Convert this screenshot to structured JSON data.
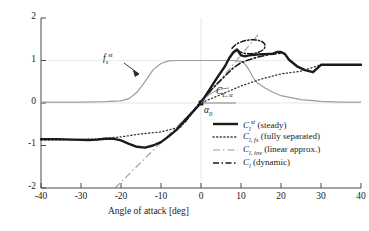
{
  "chart_data": {
    "type": "line",
    "title": "",
    "xlabel": "Angle of attack [deg]",
    "ylabel": "",
    "xlim": [
      -40,
      40
    ],
    "ylim": [
      -2,
      2
    ],
    "xticks": [
      "-40",
      "-30",
      "-20",
      "-10",
      "0",
      "10",
      "20",
      "30",
      "40"
    ],
    "xtick_values": [
      -40,
      -30,
      -20,
      -10,
      0,
      10,
      20,
      30,
      40
    ],
    "yticks": [
      "-2",
      "-1",
      "0",
      "1",
      "2"
    ],
    "ytick_values": [
      -2,
      -1,
      0,
      1,
      2
    ],
    "grid": "partial-light",
    "legend_position": "lower-right-inside",
    "series": [
      {
        "name": "Cl_st_steady",
        "label_html": "<i>C<sub>l</sub><sup>st</sup></i> (steady)",
        "style": "solid",
        "width": 2.4,
        "color": "#1a1a1a",
        "x": [
          -40,
          -36,
          -32,
          -28,
          -24,
          -22,
          -20,
          -18,
          -16,
          -14,
          -12,
          -10,
          -8,
          -6,
          -4,
          -2.5,
          0,
          2,
          4,
          6,
          8,
          9,
          10,
          11,
          12,
          13,
          14,
          16,
          18,
          20,
          21,
          22,
          23,
          24,
          26,
          28,
          30,
          32,
          34,
          36,
          38,
          40
        ],
        "y": [
          -0.85,
          -0.85,
          -0.86,
          -0.87,
          -0.87,
          -0.86,
          -0.84,
          -0.84,
          -0.88,
          -0.96,
          -1.03,
          -1.05,
          -1.0,
          -0.92,
          -0.78,
          -0.62,
          -0.3,
          0.0,
          0.3,
          0.62,
          0.92,
          1.05,
          1.14,
          1.2,
          1.12,
          1.1,
          1.12,
          1.14,
          1.15,
          1.16,
          1.2,
          1.21,
          1.19,
          1.12,
          1.0,
          0.94,
          0.91,
          0.9,
          0.9,
          0.9,
          0.9,
          0.9
        ]
      },
      {
        "name": "Cl_fs_fully_separated",
        "label_html": "<i>C<sub>l, fs</sub></i> (fully separated)",
        "style": "dotted",
        "width": 1.3,
        "color": "#3a3a3a",
        "x": [
          -40,
          -36,
          -32,
          -28,
          -24,
          -20,
          -16,
          -12,
          -8,
          -4,
          0,
          4,
          8,
          12,
          16,
          20,
          24,
          28,
          32,
          36,
          40
        ],
        "y": [
          -0.87,
          -0.87,
          -0.86,
          -0.84,
          -0.8,
          -0.75,
          -0.68,
          -0.56,
          -0.4,
          -0.2,
          0.0,
          0.2,
          0.4,
          0.56,
          0.68,
          0.78,
          0.85,
          0.89,
          0.9,
          0.9,
          0.9
        ]
      },
      {
        "name": "Cl_inv_linear_approx",
        "label_html": "<i>C<sub>l, inv</sub></i> (linear approx.)",
        "style": "dashdot-light",
        "width": 1.0,
        "color": "#8a8a8a",
        "x": [
          -21.5,
          0,
          14.5
        ],
        "y": [
          -2.0,
          0.0,
          1.75
        ]
      },
      {
        "name": "Cl_dynamic",
        "label_html": "<i>C<sub>l</sub></i> (dynamic)",
        "style": "dashdot-dark",
        "width": 1.6,
        "color": "#1a1a1a",
        "x": [
          -4,
          0,
          4,
          8,
          10,
          12,
          14,
          16,
          18,
          20,
          22
        ],
        "y": [
          -0.45,
          0.05,
          0.45,
          0.82,
          0.95,
          1.02,
          1.07,
          1.1,
          1.13,
          1.15,
          1.16
        ],
        "loop_note": "small hysteresis loop above the steady peak near 12-18 deg"
      },
      {
        "name": "fs_st_separation_function",
        "label_html": "",
        "style": "solid-thin-gray",
        "width": 1.1,
        "color": "#9a9a9a",
        "x": [
          -40,
          -30,
          -24,
          -20,
          -18,
          -16,
          -14,
          -12,
          -10,
          -8,
          -6,
          -4,
          0,
          4,
          8,
          10,
          11,
          12,
          13,
          14,
          16,
          18,
          20,
          24,
          28,
          32,
          36,
          40
        ],
        "y": [
          0.02,
          0.02,
          0.03,
          0.05,
          0.1,
          0.25,
          0.5,
          0.78,
          0.93,
          0.99,
          1.0,
          1.0,
          1.0,
          1.0,
          1.0,
          0.98,
          0.92,
          0.78,
          0.6,
          0.48,
          0.35,
          0.25,
          0.17,
          0.08,
          0.04,
          0.02,
          0.02,
          0.02
        ]
      }
    ],
    "annotations": [
      {
        "name": "fs-st-label",
        "text_html": "<i>f<sub>s</sub><sup>st</sup></i>",
        "x": -21,
        "y": 1.22
      },
      {
        "name": "cl-alpha-label",
        "text_html": "<i>C<sub>L, α</sub></i>",
        "x": 4.5,
        "y": 0.38
      },
      {
        "name": "alpha-zero-label",
        "text_html": "α<sub>0</sub>",
        "x": -2.5,
        "y": -0.22
      }
    ]
  },
  "axes": {
    "xlabel": "Angle of attack [deg]",
    "xticks": [
      "-40",
      "-30",
      "-20",
      "-10",
      "0",
      "10",
      "20",
      "30",
      "40"
    ],
    "yticks": [
      "2",
      "1",
      "0",
      "-1",
      "-2"
    ]
  },
  "legend": {
    "items": [
      {
        "name": "legend-steady",
        "label_html": "<i>C<sub>l</sub><sup>st</sup></i> (steady)"
      },
      {
        "name": "legend-fully-separated",
        "label_html": "<i>C<sub>l, fs</sub></i> (fully separated)"
      },
      {
        "name": "legend-linear-approx",
        "label_html": "<i>C<sub>l, inv</sub></i> (linear approx.)"
      },
      {
        "name": "legend-dynamic",
        "label_html": "<i>C<sub>l</sub></i> (dynamic)"
      }
    ]
  },
  "colors": {
    "ink": "#1a1a1a",
    "gray_curve": "#9a9a9a",
    "light_gray": "#b8b8b8",
    "grid": "#d8d8d8",
    "background": "#ffffff"
  }
}
